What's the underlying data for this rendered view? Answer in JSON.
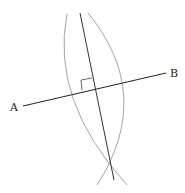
{
  "diagram": {
    "points": {
      "A": {
        "label": "A",
        "x": 23,
        "y": 106
      },
      "B": {
        "label": "B",
        "x": 166,
        "y": 73
      }
    },
    "labels": {
      "a": "A",
      "b": "B"
    },
    "colors": {
      "segment": "#222222",
      "bisector": "#333333",
      "arc": "#8a8a8a",
      "right_angle": "#444444"
    }
  }
}
